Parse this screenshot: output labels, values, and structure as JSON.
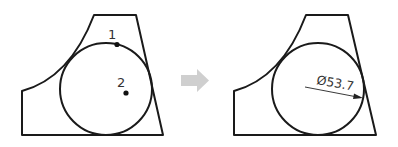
{
  "diagram": {
    "before": {
      "point_labels": [
        "1",
        "2"
      ]
    },
    "arrow": {
      "icon": "right-arrow-icon",
      "color": "#c8c8c8"
    },
    "after": {
      "dimension_text": "Ø53.7"
    }
  }
}
